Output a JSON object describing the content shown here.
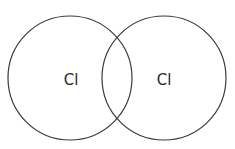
{
  "diagram": {
    "type": "venn-overlap",
    "stroke_color": "#3a3a3a",
    "atoms": [
      {
        "label": "Cl",
        "cx": 70,
        "cy": 78,
        "r": 62
      },
      {
        "label": "Cl",
        "cx": 164,
        "cy": 78,
        "r": 62
      }
    ]
  }
}
